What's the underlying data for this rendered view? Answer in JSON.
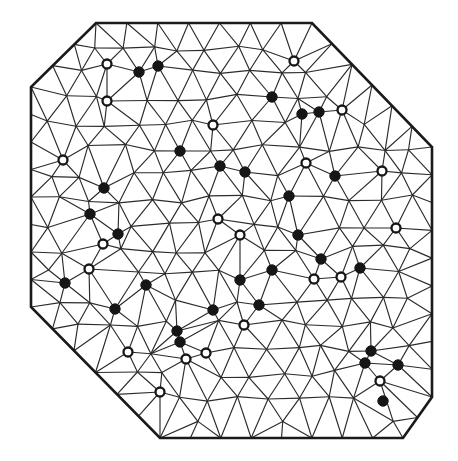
{
  "figure": {
    "width": 458,
    "height": 461,
    "background_color": "#ffffff",
    "edge_color": "#2b2b2b",
    "boundary_color": "#1a1a1a",
    "node_filled_color": "#161616",
    "node_open_fill": "#ffffff",
    "node_radius": 5.2,
    "legend": {
      "filled_label": "filled node",
      "open_label": "open node"
    }
  },
  "chart_data": {
    "type": "diagram",
    "xlabel": "",
    "ylabel": "",
    "xlim": [
      0,
      458
    ],
    "ylim": [
      0,
      461
    ],
    "grid": false,
    "legend_position": "none",
    "boundary": {
      "name": "octagon-outline",
      "closed": true,
      "points": [
        [
          96,
          23
        ],
        [
          312,
          23
        ],
        [
          432,
          147
        ],
        [
          432,
          397
        ],
        [
          403,
          438
        ],
        [
          160,
          438
        ],
        [
          31,
          307
        ],
        [
          31,
          87
        ]
      ]
    },
    "counts": {
      "filled_nodes": 29,
      "open_nodes": 21,
      "total_marked_nodes": 50
    },
    "filled_nodes": [
      [
        139,
        72
      ],
      [
        272,
        97
      ],
      [
        302,
        114
      ],
      [
        319,
        112
      ],
      [
        180,
        151
      ],
      [
        220,
        166
      ],
      [
        245,
        172
      ],
      [
        104,
        188
      ],
      [
        118,
        234
      ],
      [
        65,
        283
      ],
      [
        115,
        309
      ],
      [
        298,
        235
      ],
      [
        272,
        270
      ],
      [
        321,
        259
      ],
      [
        360,
        268
      ],
      [
        240,
        280
      ],
      [
        177,
        331
      ],
      [
        180,
        342
      ],
      [
        371,
        351
      ],
      [
        365,
        363
      ],
      [
        398,
        365
      ],
      [
        383,
        401
      ],
      [
        158,
        66
      ],
      [
        259,
        305
      ],
      [
        90,
        214
      ],
      [
        213,
        310
      ],
      [
        335,
        176
      ],
      [
        289,
        196
      ],
      [
        146,
        285
      ]
    ],
    "open_nodes": [
      [
        107,
        64
      ],
      [
        107,
        101
      ],
      [
        294,
        61
      ],
      [
        342,
        110
      ],
      [
        382,
        171
      ],
      [
        240,
        235
      ],
      [
        314,
        279
      ],
      [
        103,
        244
      ],
      [
        89,
        269
      ],
      [
        128,
        352
      ],
      [
        186,
        359
      ],
      [
        206,
        353
      ],
      [
        244,
        325
      ],
      [
        380,
        381
      ],
      [
        341,
        277
      ],
      [
        63,
        160
      ],
      [
        218,
        219
      ],
      [
        160,
        392
      ],
      [
        306,
        163
      ],
      [
        213,
        125
      ],
      [
        396,
        228
      ]
    ]
  }
}
